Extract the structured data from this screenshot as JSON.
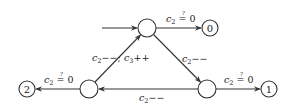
{
  "diagram": {
    "type": "state-machine",
    "nodes": {
      "top": {
        "label": "",
        "cx": 147,
        "cy": 28,
        "r": 9
      },
      "bottom_left": {
        "label": "",
        "cx": 89,
        "cy": 89,
        "r": 9
      },
      "bottom_right": {
        "label": "",
        "cx": 207,
        "cy": 89,
        "r": 9
      },
      "final0": {
        "label": "0",
        "cx": 210,
        "cy": 28,
        "r": 8
      },
      "final1": {
        "label": "1",
        "cx": 269,
        "cy": 89,
        "r": 8
      },
      "final2": {
        "label": "2",
        "cx": 27,
        "cy": 89,
        "r": 8
      }
    },
    "edges": {
      "entry": {
        "from": "start",
        "to": "top",
        "label": ""
      },
      "top_to_final0": {
        "from": "top",
        "to": "final0",
        "var": "c",
        "sub": "2",
        "op": " = 0",
        "qmark": "?"
      },
      "top_to_bottom_right": {
        "from": "top",
        "to": "bottom_right",
        "var": "c",
        "sub": "2",
        "op": "−−"
      },
      "bottom_right_to_final1": {
        "from": "bottom_right",
        "to": "final1",
        "var": "c",
        "sub": "2",
        "op": " = 0",
        "qmark": "?"
      },
      "bottom_right_to_bottom_left": {
        "from": "bottom_right",
        "to": "bottom_left",
        "var": "c",
        "sub": "2",
        "op": "−−"
      },
      "bottom_left_to_final2": {
        "from": "bottom_left",
        "to": "final2",
        "var": "c",
        "sub": "2",
        "op": " = 0",
        "qmark": "?"
      },
      "bottom_left_to_top": {
        "from": "bottom_left",
        "to": "top",
        "left_var": "c",
        "left_sub": "2",
        "left_op": "−−;",
        "right_var": "c",
        "right_sub": "3",
        "right_op": "++"
      }
    }
  }
}
